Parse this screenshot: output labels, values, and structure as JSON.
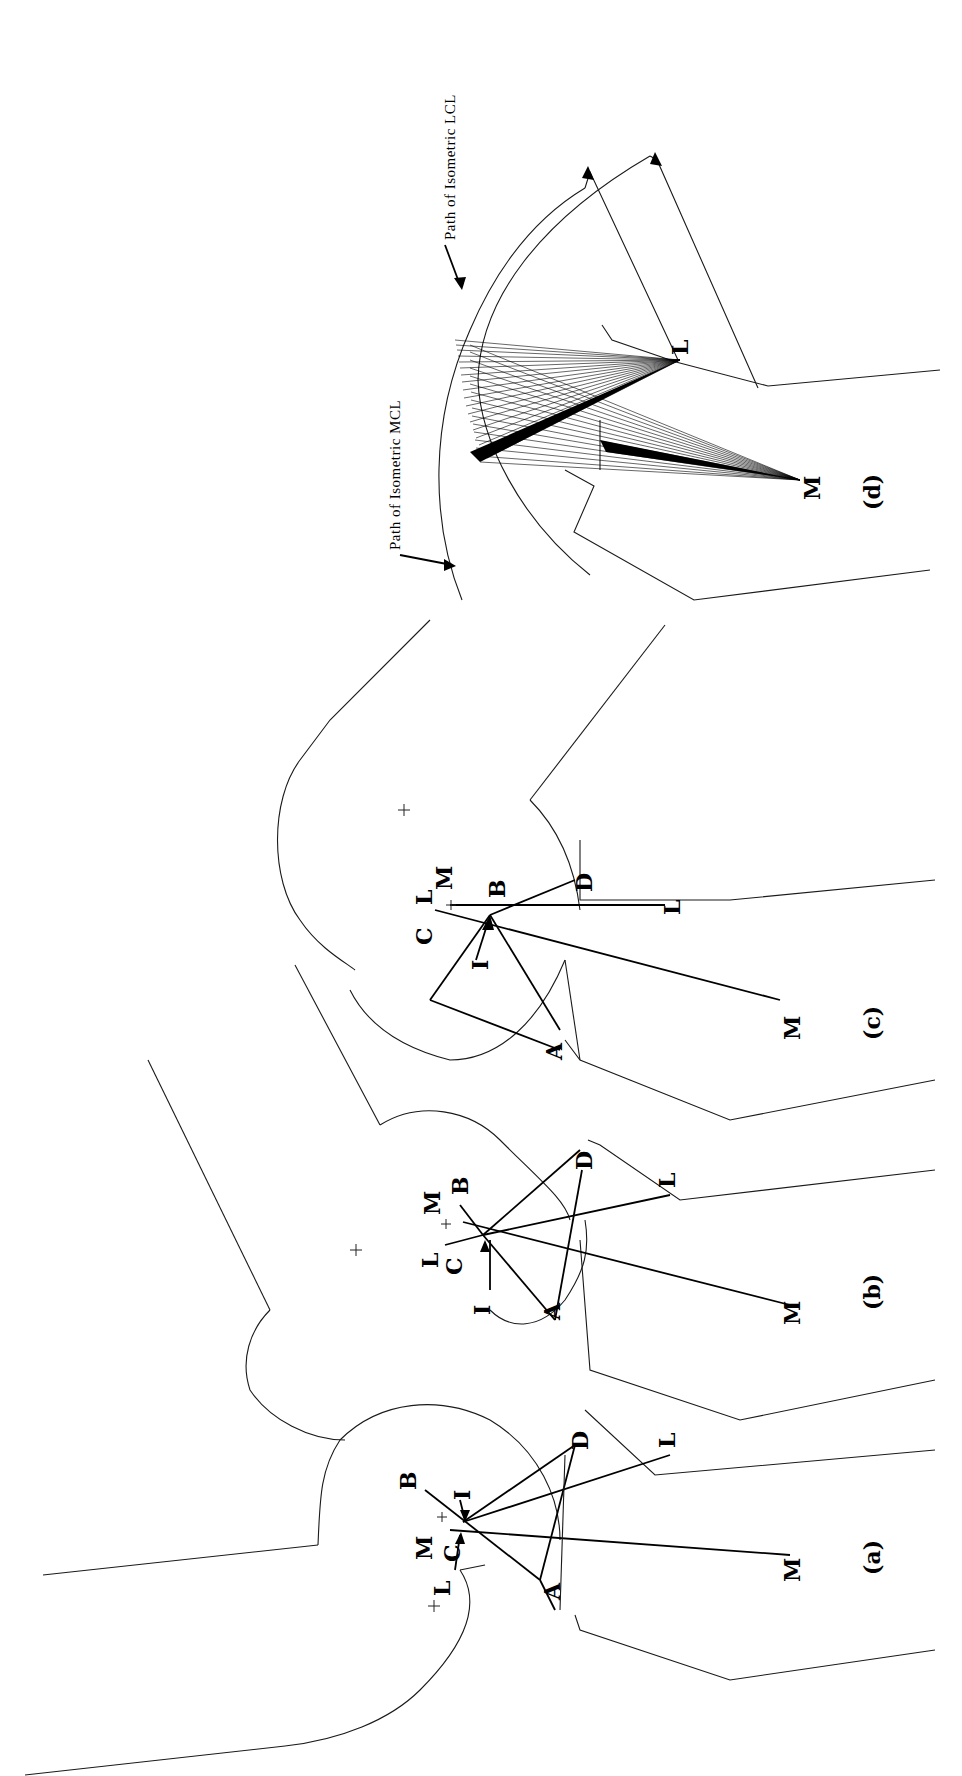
{
  "figure": {
    "panels": [
      {
        "id": "a",
        "caption": "(a)",
        "labels": {
          "L_top": "L",
          "M_top": "M",
          "C": "C",
          "B": "B",
          "I": "I",
          "A": "A",
          "D": "D",
          "L": "L",
          "M": "M"
        }
      },
      {
        "id": "b",
        "caption": "(b)",
        "labels": {
          "L_top": "L",
          "M_top": "M",
          "C": "C",
          "B": "B",
          "I": "I",
          "A": "A",
          "D": "D",
          "L": "L",
          "M": "M"
        }
      },
      {
        "id": "c",
        "caption": "(c)",
        "labels": {
          "C": "C",
          "L_top": "L",
          "M_top": "M",
          "B": "B",
          "I": "I",
          "A": "A",
          "D": "D",
          "L": "L",
          "M": "M"
        }
      },
      {
        "id": "d",
        "caption": "(d)",
        "labels": {
          "L": "L",
          "M": "M"
        }
      }
    ],
    "annotations": {
      "mcl_path": "Path of Isometric MCL",
      "lcl_path": "Path of Isometric LCL"
    }
  }
}
